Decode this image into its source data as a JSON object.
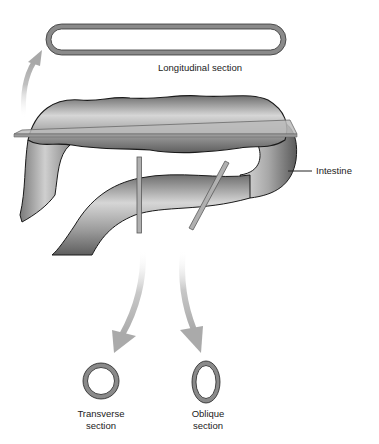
{
  "diagram": {
    "labels": {
      "longitudinal": "Longitudinal section",
      "intestine": "Intestine",
      "transverse_line1": "Transverse",
      "transverse_line2": "section",
      "oblique_line1": "Oblique",
      "oblique_line2": "section"
    },
    "colors": {
      "tube_fill": "#9a9a9a",
      "tube_outline": "#1a1a1a",
      "plane_fill": "#b5b5b5",
      "plane_edge": "#6a6a6a",
      "arrow": "#b0b0b0",
      "section_ring": "#8a8a8a"
    },
    "planes": [
      "longitudinal",
      "transverse",
      "oblique"
    ]
  }
}
